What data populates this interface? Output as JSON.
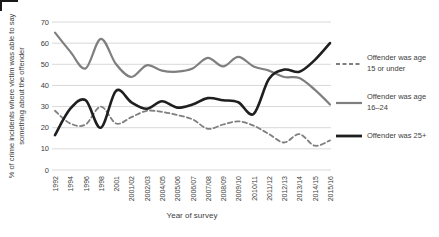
{
  "chart_data": {
    "type": "line",
    "title": "",
    "xlabel": "Year of survey",
    "ylabel": "% of crime incidents where victim was able to say something about the offender",
    "ylim": [
      0,
      70
    ],
    "ytick_step": 10,
    "grid": "horizontal",
    "legend_position": "right",
    "smooth_lines": true,
    "categories": [
      "1992",
      "1994",
      "1996",
      "1998",
      "2001",
      "2001/02",
      "2002/03",
      "2004/05",
      "2005/06",
      "2006/07",
      "2007/08",
      "2008/09",
      "2009/10",
      "2010/11",
      "2011/12",
      "2012/13",
      "2013/14",
      "2014/15",
      "2015/16"
    ],
    "series": [
      {
        "name": "Offender was age 15 or under",
        "style": "dashed",
        "color": "#7f7f7f",
        "values": [
          28,
          22,
          21.5,
          30,
          22,
          25,
          28,
          27.5,
          26,
          24,
          19.5,
          21.5,
          23,
          21,
          17,
          13,
          17,
          11.5,
          14
        ]
      },
      {
        "name": "Offender was age 16–24",
        "style": "solid",
        "color": "#7f7f7f",
        "values": [
          65,
          56,
          48,
          62,
          50,
          44,
          49.5,
          47,
          46.5,
          48,
          53,
          49,
          53.5,
          49,
          47,
          44,
          43.5,
          38,
          31
        ]
      },
      {
        "name": "Offender was 25+",
        "style": "solid",
        "color": "#1f1f1f",
        "values": [
          16.5,
          29,
          33,
          20,
          37.5,
          32,
          29,
          32.5,
          29.5,
          31,
          34,
          33,
          32,
          26.5,
          43,
          47.5,
          46.5,
          52,
          60
        ]
      }
    ],
    "colors": {
      "gridline": "#d9d9d9",
      "text": "#404040",
      "background": "#ffffff"
    }
  }
}
